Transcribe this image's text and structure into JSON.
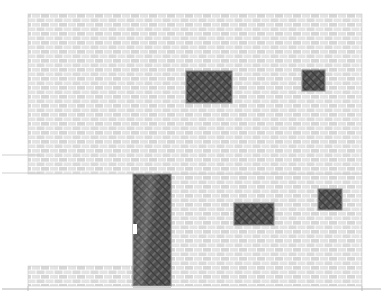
{
  "drawing": {
    "type": "architectural-elevation",
    "title": "Building Elevation",
    "canvas": {
      "width": 383,
      "height": 299
    },
    "colors": {
      "background": "#ffffff",
      "brick_face": "#d8d8d8",
      "brick_face_light": "#e4e4e4",
      "mortar": "#ffffff",
      "wall_outline": "#bdbdbd",
      "opening_fill": "#4a4a4a",
      "opening_hatch": "#6e6e6e",
      "opening_outline": "#9a9a9a",
      "ground_line": "#b0b0b0",
      "setback_line": "#c4c4c4"
    },
    "hatch": {
      "brick_unit_width": 9,
      "brick_unit_height": 4.5,
      "mortar_width": 1,
      "opening_hatch_spacing": 4
    }
  },
  "walls": [
    {
      "id": "upper-main-wall",
      "label": "Upper masonry wall",
      "x": 28,
      "y": 14,
      "width": 334,
      "height": 160
    },
    {
      "id": "lower-right-wall",
      "label": "Lower masonry wall (right of recess)",
      "x": 171,
      "y": 174,
      "width": 191,
      "height": 112
    },
    {
      "id": "lower-left-plinth",
      "label": "Lower plinth wall (left)",
      "x": 28,
      "y": 266,
      "width": 105,
      "height": 20
    }
  ],
  "openings": [
    {
      "id": "window-upper-center",
      "label": "Upper centre window",
      "kind": "window",
      "x": 186,
      "y": 71,
      "width": 46,
      "height": 32
    },
    {
      "id": "window-upper-right",
      "label": "Upper right window",
      "kind": "window",
      "x": 302,
      "y": 70,
      "width": 23,
      "height": 21
    },
    {
      "id": "window-lower-center",
      "label": "Lower centre window",
      "kind": "window",
      "x": 234,
      "y": 203,
      "width": 40,
      "height": 22
    },
    {
      "id": "window-lower-right",
      "label": "Lower right window",
      "kind": "window",
      "x": 318,
      "y": 189,
      "width": 24,
      "height": 21
    },
    {
      "id": "door-entrance",
      "label": "Entrance door",
      "kind": "door",
      "x": 133,
      "y": 174,
      "width": 38,
      "height": 112
    }
  ],
  "door_handle": {
    "id": "door-handle-notch",
    "label": "Door handle recess",
    "x": 133,
    "y": 224,
    "width": 4,
    "height": 10
  },
  "lines": [
    {
      "id": "setback-line-upper",
      "label": "Upper setback projection line",
      "x1": 2,
      "y1": 155,
      "x2": 40,
      "y2": 155
    },
    {
      "id": "setback-line-lower",
      "label": "Lower setback projection line",
      "x1": 2,
      "y1": 173,
      "x2": 40,
      "y2": 173
    },
    {
      "id": "ground-line",
      "label": "Ground / datum line",
      "x1": 2,
      "y1": 289,
      "x2": 381,
      "y2": 289
    },
    {
      "id": "plinth-return-left",
      "label": "Left plinth vertical return",
      "x1": 28,
      "y1": 286,
      "x2": 28,
      "y2": 291
    },
    {
      "id": "plinth-return-right",
      "label": "Right plinth vertical return",
      "x1": 362,
      "y1": 286,
      "x2": 362,
      "y2": 291
    }
  ],
  "threshold": {
    "id": "door-threshold",
    "label": "Door threshold",
    "x": 133,
    "y": 286,
    "width": 38,
    "height": 2
  }
}
